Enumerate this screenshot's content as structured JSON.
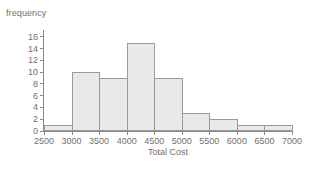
{
  "chart_data": {
    "type": "bar",
    "title": "",
    "subtitle": "",
    "xlabel": "Total Cost",
    "ylabel": "frequency",
    "grid": false,
    "legend": null,
    "bin_width": 500,
    "bin_edges": [
      2500,
      3000,
      3500,
      4000,
      4500,
      5000,
      5500,
      6000,
      6500,
      7000
    ],
    "categories": [
      "2500-3000",
      "3000-3500",
      "3500-4000",
      "4000-4500",
      "4500-5000",
      "5000-5500",
      "5500-6000",
      "6000-6500",
      "6500-7000"
    ],
    "values": [
      1,
      10,
      9,
      15,
      9,
      3,
      2,
      1,
      1
    ],
    "xlim": [
      2500,
      7000
    ],
    "ylim": [
      0,
      17
    ],
    "xticks": [
      2500,
      3000,
      3500,
      4000,
      4500,
      5000,
      5500,
      6000,
      6500,
      7000
    ],
    "xtick_labels": [
      "2500",
      "3000",
      "3500",
      "4000",
      "4500",
      "5000",
      "5500",
      "6000",
      "6500",
      "7000"
    ],
    "yticks": [
      0,
      2,
      4,
      6,
      8,
      10,
      12,
      14,
      16
    ],
    "ytick_labels": [
      "0",
      "2",
      "4",
      "6",
      "8",
      "10",
      "12",
      "14",
      "16"
    ],
    "colors": {
      "bar_fill": "#e9e9e9",
      "bar_edge": "#9a9a9a",
      "axis": "#8a8a8a",
      "text": "#6f6f6f",
      "background": "#ffffff"
    }
  }
}
